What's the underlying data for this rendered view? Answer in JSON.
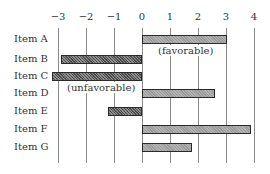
{
  "chart_data": {
    "type": "bar",
    "orientation": "horizontal",
    "title": "",
    "xlabel": "",
    "ylabel": "",
    "xlim": [
      -3,
      4
    ],
    "x_ticks": [
      -3,
      -2,
      -1,
      0,
      1,
      2,
      3,
      4
    ],
    "x_tick_labels": [
      "−3",
      "−2",
      "−1",
      "0",
      "1",
      "2",
      "3",
      "4"
    ],
    "grid": true,
    "legend": null,
    "categories": [
      "Item A",
      "Item B",
      "Item C",
      "Item D",
      "Item E",
      "Item F",
      "Item G"
    ],
    "values": [
      3.05,
      -2.9,
      -3.2,
      2.6,
      -1.2,
      3.9,
      1.8
    ],
    "annotations": [
      {
        "text": "(favorable)",
        "near": "positive side, below Item A"
      },
      {
        "text": "(unfavorable)",
        "near": "negative side, below Item C"
      }
    ]
  },
  "labels": {
    "favorable": "(favorable)",
    "unfavorable": "(unfavorable)"
  },
  "colors": {
    "positive_bar": "#9a9a9a",
    "negative_bar": "#5a5a5a",
    "gridline": "#8a8a8a",
    "text": "#333333"
  }
}
